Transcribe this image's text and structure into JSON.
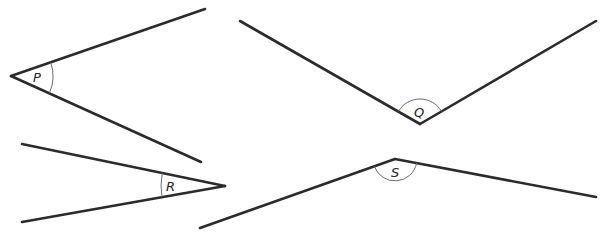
{
  "diagram": {
    "line_color": "#2b2b2b",
    "arc_color": "#6a6a6a",
    "angles": [
      {
        "label": "P",
        "vertex": [
          11,
          76
        ],
        "ray_ends": [
          [
            205,
            9
          ],
          [
            201,
            162
          ]
        ],
        "arc_radius": 42,
        "label_pos": [
          33,
          82
        ],
        "type": "acute"
      },
      {
        "label": "Q",
        "vertex": [
          420,
          124
        ],
        "ray_ends": [
          [
            240,
            21
          ],
          [
            596,
            21
          ]
        ],
        "arc_radius": 25,
        "label_pos": [
          414,
          117
        ],
        "type": "obtuse"
      },
      {
        "label": "R",
        "vertex": [
          225,
          186
        ],
        "ray_ends": [
          [
            22,
            144
          ],
          [
            22,
            222
          ]
        ],
        "arc_radius": 64,
        "label_pos": [
          166,
          191
        ],
        "type": "acute"
      },
      {
        "label": "S",
        "vertex": [
          395,
          159
        ],
        "ray_ends": [
          [
            200,
            228
          ],
          [
            596,
            197
          ]
        ],
        "arc_radius": 22,
        "label_pos": [
          391,
          177
        ],
        "type": "reflex-side/obtuse"
      }
    ]
  }
}
